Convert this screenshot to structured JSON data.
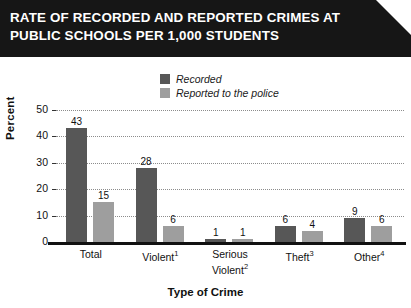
{
  "title": {
    "line1": "RATE OF RECORDED AND REPORTED CRIMES AT",
    "line2": "PUBLIC SCHOOLS PER 1,000 STUDENTS"
  },
  "colors": {
    "recorded": "#575757",
    "reported": "#9e9e9e",
    "banner": "#161616",
    "text": "#111111",
    "gridline": "#8c8c8c"
  },
  "legend": {
    "position": "top-center",
    "items": [
      {
        "label": "Recorded",
        "color": "#575757"
      },
      {
        "label": "Reported to the police",
        "color": "#9e9e9e"
      }
    ]
  },
  "axes": {
    "y_title": "Percent",
    "x_title": "Type of Crime",
    "y_ticks": [
      "0",
      "10",
      "20",
      "30",
      "40",
      "50"
    ]
  },
  "categories_display": [
    {
      "line1": "Total",
      "line2": "",
      "sup": ""
    },
    {
      "line1": "Violent",
      "line2": "",
      "sup": "1"
    },
    {
      "line1": "Serious",
      "line2": "Violent",
      "sup": "2"
    },
    {
      "line1": "Theft",
      "line2": "",
      "sup": "3"
    },
    {
      "line1": "Other",
      "line2": "",
      "sup": "4"
    }
  ],
  "chart_data": {
    "type": "bar",
    "title": "RATE OF RECORDED AND REPORTED CRIMES AT PUBLIC SCHOOLS PER 1,000 STUDENTS",
    "xlabel": "Type of Crime",
    "ylabel": "Percent",
    "ylim": [
      0,
      50
    ],
    "yticks": [
      0,
      10,
      20,
      30,
      40,
      50
    ],
    "grid": true,
    "legend_position": "top-center",
    "categories": [
      "Total",
      "Violent",
      "Serious Violent",
      "Theft",
      "Other"
    ],
    "series": [
      {
        "name": "Recorded",
        "color": "#575757",
        "values": [
          43,
          28,
          1,
          6,
          9
        ]
      },
      {
        "name": "Reported to the police",
        "color": "#9e9e9e",
        "values": [
          15,
          6,
          1,
          4,
          6
        ]
      }
    ],
    "value_labels": {
      "Recorded": [
        "43",
        "28",
        "1",
        "6",
        "9"
      ],
      "Reported to the police": [
        "15",
        "6",
        "1",
        "4",
        "6"
      ]
    }
  }
}
